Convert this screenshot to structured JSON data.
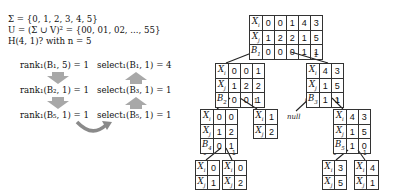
{
  "definitions": {
    "sigma": "Σ = {0, 1, 2, 3, 4, 5}",
    "universe": "U = (Σ ∪ V)² = {00, 01, 02, ..., 55}",
    "query": "H(4, 1)? with n = 5"
  },
  "operations": [
    {
      "rank": "rank₁(B₁, 5) = 1",
      "select": "select₁(B₁, 1) = 4"
    },
    {
      "rank": "rank₁(B₂, 1) = 1",
      "select": "select₁(B₃, 1) = 1"
    },
    {
      "rank": "rank₁(B₅, 1) = 1",
      "select": "select₁(B₅, 1) = 1"
    }
  ],
  "tree": {
    "root": {
      "xi": [
        "0",
        "0",
        "1",
        "4",
        "3"
      ],
      "xj": [
        "1",
        "2",
        "2",
        "1",
        "5"
      ],
      "b_label": "B",
      "b_sub": "1",
      "b": [
        "0",
        "0",
        "0",
        "1",
        "1"
      ]
    },
    "level2_left": {
      "xi": [
        "0",
        "0",
        "1"
      ],
      "xj": [
        "1",
        "2",
        "2"
      ],
      "b_label": "B",
      "b_sub": "2",
      "b": [
        "0",
        "0",
        "1"
      ]
    },
    "level2_right": {
      "xi": [
        "4",
        "3"
      ],
      "xj": [
        "1",
        "5"
      ],
      "b_label": "B",
      "b_sub": "3",
      "b": [
        "1",
        "1"
      ]
    },
    "level3_ll": {
      "xi": [
        "0",
        "0"
      ],
      "xj": [
        "1",
        "2"
      ],
      "b_label": "B",
      "b_sub": "4",
      "b": [
        "0",
        "1"
      ]
    },
    "level3_lr": {
      "xi": [
        "1"
      ],
      "xj": [
        "2"
      ]
    },
    "level3_rl": "null",
    "level3_rr": {
      "xi": [
        "4",
        "3"
      ],
      "xj": [
        "1",
        "5"
      ],
      "b_label": "B",
      "b_sub": "5",
      "b": [
        "1",
        "0"
      ]
    },
    "leaf_1": {
      "xi": [
        "0"
      ],
      "xj": [
        "1"
      ]
    },
    "leaf_2": {
      "xi": [
        "0"
      ],
      "xj": [
        "2"
      ]
    },
    "leaf_3": {
      "xi": [
        "3"
      ],
      "xj": [
        "5"
      ]
    },
    "leaf_4": {
      "xi": [
        "4"
      ],
      "xj": [
        "1"
      ]
    },
    "edge_labels": {
      "zero": "0",
      "one": "1"
    },
    "row_labels": {
      "xi": "X",
      "xi_sub": "i",
      "xj": "X",
      "xj_sub": "j"
    }
  },
  "colors": {
    "arrow_fill": "#a8a8a8",
    "line": "#333333",
    "curved_arrow": "#8a8a8a"
  }
}
